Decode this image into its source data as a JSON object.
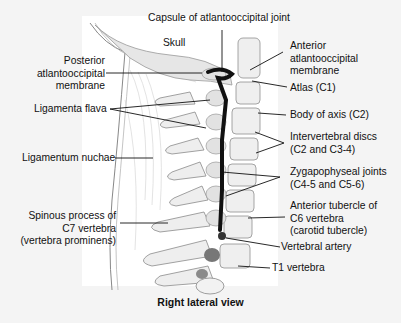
{
  "figure": {
    "caption": "Right lateral view",
    "region_labels": {
      "skull": "Skull"
    },
    "labels": {
      "capsule": "Capsule of atlantooccipital joint",
      "posterior_membrane": [
        "Posterior",
        "atlantooccipital",
        "membrane"
      ],
      "ligamenta_flava": "Ligamenta flava",
      "ligamentum_nuchae": "Ligamentum nuchae",
      "spinous_c7": [
        "Spinous process of",
        "C7 vertebra",
        "(vertebra prominens)"
      ],
      "anterior_membrane": [
        "Anterior",
        "atlantooccipital",
        "membrane"
      ],
      "atlas": "Atlas (C1)",
      "body_axis": "Body of axis (C2)",
      "discs": [
        "Intervertebral discs",
        "(C2 and C3-4)"
      ],
      "zygapophyseal": [
        "Zygapophyseal joints",
        "(C4-5 and C5-6)"
      ],
      "anterior_tubercle": [
        "Anterior tubercle of",
        "C6 vertebra",
        "(carotid tubercle)"
      ],
      "vertebral_artery": "Vertebral artery",
      "t1": "T1 vertebra"
    },
    "colors": {
      "background": "#f4f4f4",
      "panel": "#ffffff",
      "bone": "#ececec",
      "bone_shade": "#c9c9c9",
      "ligament_dark": "#111111",
      "artery": "#555555",
      "leader": "#111111"
    }
  }
}
